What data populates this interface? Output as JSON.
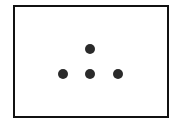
{
  "diagram": {
    "frame": {
      "border_color": "#111111",
      "background": "#ffffff"
    },
    "dots": [
      {
        "id": "top",
        "x": 90,
        "y": 49,
        "color": "#2a2a2a"
      },
      {
        "id": "bottom-left",
        "x": 63,
        "y": 74,
        "color": "#2a2a2a"
      },
      {
        "id": "bottom-center",
        "x": 90,
        "y": 74,
        "color": "#2a2a2a"
      },
      {
        "id": "bottom-right",
        "x": 118,
        "y": 74,
        "color": "#2a2a2a"
      }
    ]
  }
}
